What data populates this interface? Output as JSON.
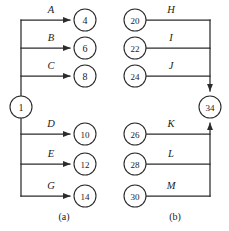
{
  "figure": {
    "background_color": "#ffffff",
    "line_color": "#2b2b2b",
    "text_color": "#1a1a1a",
    "width": 229,
    "height": 231
  },
  "diagram_a": {
    "caption": "(a)",
    "caption_x": 64,
    "caption_y": 220,
    "source_node": {
      "label": "1",
      "cx": 21,
      "cy": 107,
      "r": 11
    },
    "trunk_x": 21,
    "branches": [
      {
        "label": "A",
        "target": "4",
        "y": 20,
        "label_x": 51,
        "label_y": 13,
        "target_cx": 85,
        "target_cy": 20,
        "target_r": 11
      },
      {
        "label": "B",
        "target": "6",
        "y": 48,
        "label_x": 51,
        "label_y": 41,
        "target_cx": 85,
        "target_cy": 48,
        "target_r": 11
      },
      {
        "label": "C",
        "target": "8",
        "y": 76,
        "label_x": 51,
        "label_y": 69,
        "target_cx": 85,
        "target_cy": 76,
        "target_r": 11
      },
      {
        "label": "D",
        "target": "10",
        "y": 134,
        "label_x": 51,
        "label_y": 127,
        "target_cx": 85,
        "target_cy": 134,
        "target_r": 11
      },
      {
        "label": "E",
        "target": "12",
        "y": 164,
        "label_x": 51,
        "label_y": 157,
        "target_cx": 85,
        "target_cy": 164,
        "target_r": 11
      },
      {
        "label": "G",
        "target": "14",
        "y": 196,
        "label_x": 51,
        "label_y": 189,
        "target_cx": 85,
        "target_cy": 196,
        "target_r": 11
      }
    ]
  },
  "diagram_b": {
    "caption": "(b)",
    "caption_x": 175,
    "caption_y": 220,
    "sink_node": {
      "label": "34",
      "cx": 210,
      "cy": 107,
      "r": 11
    },
    "trunk_x": 210,
    "branches": [
      {
        "label": "H",
        "source": "20",
        "y": 20,
        "label_x": 171,
        "label_y": 13,
        "source_cx": 135,
        "source_cy": 20,
        "source_r": 11
      },
      {
        "label": "I",
        "source": "22",
        "y": 48,
        "label_x": 171,
        "label_y": 41,
        "source_cx": 135,
        "source_cy": 48,
        "source_r": 11
      },
      {
        "label": "J",
        "source": "24",
        "y": 76,
        "label_x": 171,
        "label_y": 69,
        "source_cx": 135,
        "source_cy": 76,
        "source_r": 11
      },
      {
        "label": "K",
        "source": "26",
        "y": 134,
        "label_x": 171,
        "label_y": 127,
        "source_cx": 135,
        "source_cy": 134,
        "source_r": 11
      },
      {
        "label": "L",
        "source": "28",
        "y": 164,
        "label_x": 171,
        "label_y": 157,
        "source_cx": 135,
        "source_cy": 164,
        "source_r": 11
      },
      {
        "label": "M",
        "source": "30",
        "y": 196,
        "label_x": 171,
        "label_y": 189,
        "source_cx": 135,
        "source_cy": 196,
        "source_r": 11
      }
    ]
  }
}
